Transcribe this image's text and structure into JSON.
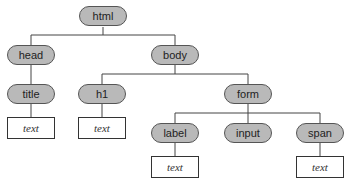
{
  "diagram": {
    "type": "tree",
    "title_visible": false,
    "colors": {
      "node_fill": "#b9b9b9",
      "node_border": "#555555",
      "line": "#444444",
      "leaf_fill": "#ffffff"
    },
    "nodes": {
      "html": "html",
      "head": "head",
      "body": "body",
      "title": "title",
      "h1": "h1",
      "form": "form",
      "label": "label",
      "input": "input",
      "span": "span"
    },
    "leaves": {
      "title_text": "text",
      "h1_text": "text",
      "label_text": "text",
      "span_text": "text"
    },
    "edges": [
      [
        "html",
        "head"
      ],
      [
        "html",
        "body"
      ],
      [
        "head",
        "title"
      ],
      [
        "title",
        "title_text"
      ],
      [
        "body",
        "h1"
      ],
      [
        "body",
        "form"
      ],
      [
        "h1",
        "h1_text"
      ],
      [
        "form",
        "label"
      ],
      [
        "form",
        "input"
      ],
      [
        "form",
        "span"
      ],
      [
        "label",
        "label_text"
      ],
      [
        "span",
        "span_text"
      ]
    ]
  }
}
